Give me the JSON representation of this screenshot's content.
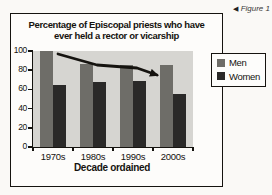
{
  "figure": {
    "caption_marker": "◀",
    "caption": "Figure 1"
  },
  "chart_data": {
    "type": "bar",
    "title": "Percentage of Episcopal priests who have ever held a rector or vicarship",
    "title_lines": [
      "Percentage of Episcopal priests who have",
      "ever held a rector or vicarship"
    ],
    "categories": [
      "1970s",
      "1980s",
      "1990s",
      "2000s"
    ],
    "series": [
      {
        "name": "Men",
        "color": "#6e6d68",
        "values": [
          100,
          86,
          85,
          85
        ]
      },
      {
        "name": "Women",
        "color": "#2a2928",
        "values": [
          65,
          68,
          69,
          55
        ]
      }
    ],
    "xlabel": "Decade ordained",
    "ylabel": "",
    "ylim": [
      0,
      100
    ],
    "yticks": [
      0,
      20,
      40,
      60,
      80,
      100
    ],
    "grid": false,
    "legend": {
      "position": "right",
      "entries": [
        "Men",
        "Women"
      ]
    },
    "plot_bg_color": "#d6d5d1",
    "annotation": {
      "type": "trend-arrow",
      "description": "black arrow sloping down from top of 1970s Men bar to top of 2000s Men bar",
      "color": "#15130f"
    }
  }
}
